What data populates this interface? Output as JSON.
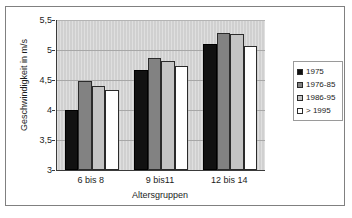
{
  "chart_data": {
    "type": "bar",
    "title": "",
    "xlabel": "Altersgruppen",
    "ylabel": "Geschwindigkeit in m/s",
    "categories": [
      "6 bis 8",
      "9 bis11",
      "12 bis 14"
    ],
    "series": [
      {
        "name": "1975",
        "color": "#111111",
        "values": [
          4.0,
          4.67,
          5.1
        ]
      },
      {
        "name": "1976-85",
        "color": "#828282",
        "values": [
          4.48,
          4.86,
          5.29
        ]
      },
      {
        "name": "1986-95",
        "color": "#c4c4c4",
        "values": [
          4.4,
          4.82,
          5.27
        ]
      },
      {
        "name": "> 1995",
        "color": "#ffffff",
        "values": [
          4.33,
          4.74,
          5.06
        ]
      }
    ],
    "ylim": [
      3,
      5.5
    ],
    "ytick_labels": [
      "5,5",
      "5",
      "4,5",
      "4",
      "3,5",
      "3"
    ],
    "ytick_values": [
      5.5,
      5.0,
      4.5,
      4.0,
      3.5,
      3.0
    ],
    "grid": "horizontal",
    "legend_position": "right",
    "plot_background": "#d0d0d0",
    "axis_color": "#3a3a3a",
    "gridline_color": "#a8a8a8"
  },
  "legend": {
    "entries": [
      {
        "label": "1975"
      },
      {
        "label": "1976-85"
      },
      {
        "label": "1986-95"
      },
      {
        "label": "> 1995"
      }
    ]
  }
}
